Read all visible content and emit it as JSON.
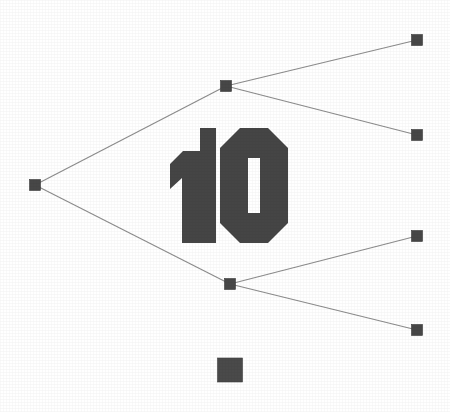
{
  "canvas": {
    "width": 450,
    "height": 412,
    "background_color": "#ffffff"
  },
  "figure": {
    "type": "node-link-tree-diagram",
    "numeral_label": "10",
    "node_color": "#474747",
    "edge_color": "#8c8c8c",
    "numeral_color": "#454545",
    "legend_swatch_color": "#4a4a4a"
  },
  "chart_data": {
    "type": "diagram",
    "title": "10",
    "node_shape": "square",
    "node_size_px": 11,
    "edge_style": "straight-line",
    "nodes": [
      {
        "id": "root",
        "label": "",
        "x": 35,
        "y": 185,
        "role": "root"
      },
      {
        "id": "n-up",
        "label": "",
        "x": 226,
        "y": 86,
        "role": "branch"
      },
      {
        "id": "n-dn",
        "label": "",
        "x": 230,
        "y": 284,
        "role": "branch"
      },
      {
        "id": "leaf-1",
        "label": "",
        "x": 417,
        "y": 40,
        "role": "leaf"
      },
      {
        "id": "leaf-2",
        "label": "",
        "x": 417,
        "y": 135,
        "role": "leaf"
      },
      {
        "id": "leaf-3",
        "label": "",
        "x": 417,
        "y": 236,
        "role": "leaf"
      },
      {
        "id": "leaf-4",
        "label": "",
        "x": 417,
        "y": 330,
        "role": "leaf"
      }
    ],
    "edges": [
      {
        "from": "root",
        "to": "n-up"
      },
      {
        "from": "root",
        "to": "n-dn"
      },
      {
        "from": "n-up",
        "to": "leaf-1"
      },
      {
        "from": "n-up",
        "to": "leaf-2"
      },
      {
        "from": "n-dn",
        "to": "leaf-3"
      },
      {
        "from": "n-dn",
        "to": "leaf-4"
      }
    ],
    "legend": {
      "swatch": {
        "x": 230,
        "y": 370,
        "width": 25,
        "height": 24
      },
      "label": ""
    }
  }
}
